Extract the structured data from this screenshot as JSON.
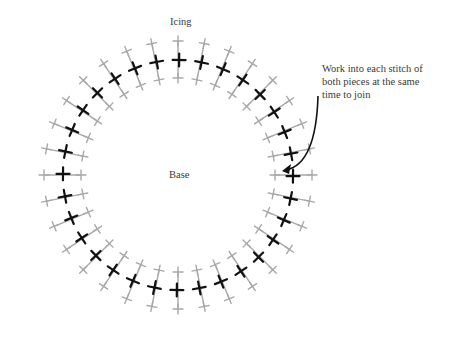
{
  "labels": {
    "outer": "Icing",
    "inner": "Base",
    "annotation_lines": [
      "Work into each stitch of",
      "both pieces at the same",
      "time to join"
    ]
  },
  "diagram": {
    "type": "crochet-join-ring",
    "center": [
      178,
      175
    ],
    "stitch_count": 32,
    "radius_join": 115,
    "radius_outer": 134,
    "radius_inner": 97,
    "join_stitch_color": "#111111",
    "piece_stitch_color": "#a8a8a8",
    "arrow_color": "#111111",
    "arrow": {
      "from": [
        318,
        136
      ],
      "to": [
        282,
        170
      ]
    }
  }
}
